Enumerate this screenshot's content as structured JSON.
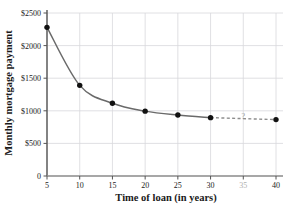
{
  "chart_data": {
    "type": "line",
    "title": "",
    "xlabel": "Time of loan (in years)",
    "ylabel": "Monthly mortgage payment",
    "x": [
      5,
      10,
      15,
      20,
      25,
      30,
      40
    ],
    "values": [
      2280,
      1390,
      1115,
      995,
      935,
      895,
      865
    ],
    "xlim": [
      5,
      40
    ],
    "ylim": [
      0,
      2500
    ],
    "xticks": [
      "5",
      "10",
      "15",
      "20",
      "25",
      "30",
      "35",
      "40"
    ],
    "xtick_values": [
      5,
      10,
      15,
      20,
      25,
      30,
      35,
      40
    ],
    "xtick_muted": [
      false,
      false,
      false,
      false,
      false,
      false,
      true,
      false
    ],
    "yticks": [
      "0",
      "$500",
      "$1000",
      "$1500",
      "$2000",
      "$2500"
    ],
    "ytick_values": [
      0,
      500,
      1000,
      1500,
      2000,
      2500
    ],
    "grid": true,
    "legend": "none",
    "annotations": [
      {
        "name": "unknown-marker",
        "text": "?",
        "x": 35,
        "y": 880
      }
    ],
    "series": [
      {
        "name": "solid-curve",
        "style": "solid",
        "points": [
          {
            "x": 5,
            "y": 2280
          },
          {
            "x": 10,
            "y": 1390
          },
          {
            "x": 15,
            "y": 1115
          },
          {
            "x": 20,
            "y": 995
          },
          {
            "x": 25,
            "y": 935
          },
          {
            "x": 30,
            "y": 895
          }
        ]
      },
      {
        "name": "dashed-extrapolation",
        "style": "dashed",
        "points": [
          {
            "x": 30,
            "y": 895
          },
          {
            "x": 40,
            "y": 865
          }
        ]
      }
    ],
    "colors": {
      "line": "#6a6a6a",
      "marker": "#111111",
      "grid": "#d8d8dc",
      "axis": "#555555",
      "text": "#1a1a1a",
      "muted_text": "#b0b0b0"
    }
  }
}
